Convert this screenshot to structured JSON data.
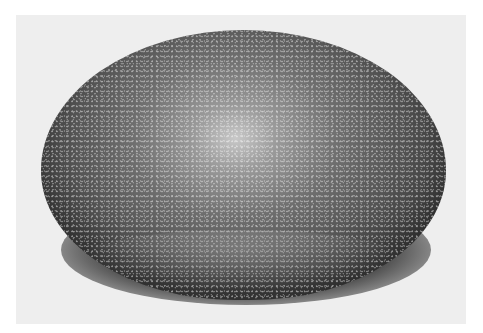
{
  "image": {
    "subject": "speckled egg-shaped stone",
    "palette": {
      "background": "#eeeeee",
      "stone_highlight": "#c8c8c8",
      "stone_mid": "#6e6e6e",
      "stone_dark": "#2c2c2c",
      "shadow": "#1a1a1a",
      "border": "#ffffff"
    }
  }
}
